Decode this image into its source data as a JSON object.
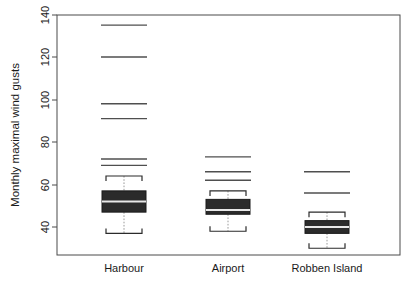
{
  "chart_data": {
    "type": "box",
    "title": "",
    "xlabel": "",
    "ylabel": "Monthly maximal wind gusts",
    "ylim": [
      30,
      142
    ],
    "yticks": [
      40,
      60,
      80,
      100,
      120,
      140
    ],
    "ytick_labels": [
      "40",
      "60",
      "80",
      "100",
      "120",
      "140"
    ],
    "grid": false,
    "legend": "none",
    "categories": [
      "Harbour",
      "Airport",
      "Robben Island"
    ],
    "boxes": [
      {
        "name": "Harbour",
        "whisker_low": 37,
        "q1": 47,
        "median": 52,
        "q3": 57,
        "whisker_high": 64,
        "outliers": [
          69,
          72,
          91,
          98,
          120,
          135
        ]
      },
      {
        "name": "Airport",
        "whisker_low": 38,
        "q1": 46,
        "median": 48,
        "q3": 53,
        "whisker_high": 57,
        "outliers": [
          62,
          66,
          73
        ]
      },
      {
        "name": "Robben Island",
        "whisker_low": 30,
        "q1": 37,
        "median": 40,
        "q3": 43,
        "whisker_high": 47,
        "outliers": [
          56,
          66
        ]
      }
    ]
  },
  "axis": {
    "ylabel": "Monthly maximal wind gusts",
    "ytick_0": "40",
    "ytick_1": "60",
    "ytick_2": "80",
    "ytick_3": "100",
    "ytick_4": "120",
    "ytick_5": "140",
    "xcat_0": "Harbour",
    "xcat_1": "Airport",
    "xcat_2": "Robben Island"
  },
  "colors": {
    "box_fill": "#2b2b2b",
    "median": "#e8e8e8",
    "frame": "#4a4a4a",
    "outlier": "#4f4f4f",
    "background": "#ffffff"
  }
}
